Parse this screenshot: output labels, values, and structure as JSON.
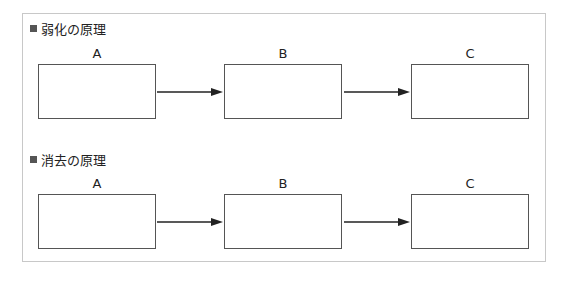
{
  "sections": [
    {
      "title": "弱化の原理",
      "nodes": [
        {
          "label": "A"
        },
        {
          "label": "B"
        },
        {
          "label": "C"
        }
      ],
      "edges": [
        {
          "from": "A",
          "to": "B"
        },
        {
          "from": "B",
          "to": "C"
        }
      ]
    },
    {
      "title": "消去の原理",
      "nodes": [
        {
          "label": "A"
        },
        {
          "label": "B"
        },
        {
          "label": "C"
        }
      ],
      "edges": [
        {
          "from": "A",
          "to": "B"
        },
        {
          "from": "B",
          "to": "C"
        }
      ]
    }
  ],
  "colors": {
    "border": "#555555",
    "frame": "#c8c8c8",
    "arrow": "#222222"
  }
}
